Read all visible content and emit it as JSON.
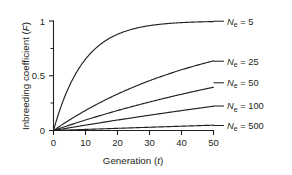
{
  "chart_data": {
    "type": "line",
    "title": "",
    "xlabel": "Generation (t)",
    "xlabel_main": "Generation (",
    "xlabel_var": "t",
    "xlabel_tail": ")",
    "ylabel": "Inbreeding coefficient (F)",
    "ylabel_main": "Inbreeding coefficient (",
    "ylabel_var": "F",
    "ylabel_tail": ")",
    "xlim": [
      0,
      50
    ],
    "ylim": [
      0,
      1
    ],
    "xticks": [
      0,
      10,
      20,
      30,
      40,
      50
    ],
    "xtick_labels": [
      "0",
      "10",
      "20",
      "30",
      "40",
      "50"
    ],
    "yticks": [
      0,
      0.5,
      1
    ],
    "ytick_labels": [
      "0",
      "0.5",
      "1"
    ],
    "yticks_minor": [
      0.25,
      0.75
    ],
    "grid": false,
    "legend_position": "right-inline-labels",
    "formula": "F = 1 - (1 - 1/(2Ne))^t",
    "series": [
      {
        "name": "Ne = 5",
        "label_prefix": "N",
        "label_sub": "e",
        "label_suffix": " = 5",
        "Ne": 5,
        "x": [
          0,
          2,
          4,
          6,
          8,
          10,
          12,
          14,
          16,
          18,
          20,
          22,
          24,
          26,
          28,
          30,
          32,
          34,
          36,
          38,
          40,
          42,
          44,
          46,
          48,
          50
        ],
        "values": [
          0,
          0.19,
          0.344,
          0.469,
          0.57,
          0.651,
          0.718,
          0.771,
          0.815,
          0.85,
          0.878,
          0.901,
          0.92,
          0.935,
          0.947,
          0.958,
          0.966,
          0.972,
          0.978,
          0.982,
          0.985,
          0.988,
          0.99,
          0.992,
          0.994,
          0.995
        ]
      },
      {
        "name": "Ne = 25",
        "label_prefix": "N",
        "label_sub": "e",
        "label_suffix": " = 25",
        "Ne": 25,
        "x": [
          0,
          5,
          10,
          15,
          20,
          25,
          30,
          35,
          40,
          45,
          50
        ],
        "values": [
          0,
          0.096,
          0.183,
          0.261,
          0.332,
          0.396,
          0.454,
          0.506,
          0.553,
          0.596,
          0.634
        ]
      },
      {
        "name": "Ne = 50",
        "label_prefix": "N",
        "label_sub": "e",
        "label_suffix": " = 50",
        "Ne": 50,
        "x": [
          0,
          5,
          10,
          15,
          20,
          25,
          30,
          35,
          40,
          45,
          50
        ],
        "values": [
          0,
          0.0494,
          0.0956,
          0.1395,
          0.1813,
          0.2209,
          0.2585,
          0.2942,
          0.3281,
          0.3603,
          0.3909
        ]
      },
      {
        "name": "Ne = 100",
        "label_prefix": "N",
        "label_sub": "e",
        "label_suffix": " = 100",
        "Ne": 100,
        "x": [
          0,
          5,
          10,
          15,
          20,
          25,
          30,
          35,
          40,
          45,
          50
        ],
        "values": [
          0,
          0.0249,
          0.0489,
          0.0724,
          0.0954,
          0.1178,
          0.1397,
          0.1611,
          0.1821,
          0.2025,
          0.2225
        ]
      },
      {
        "name": "Ne = 500",
        "label_prefix": "N",
        "label_sub": "e",
        "label_suffix": " = 500",
        "Ne": 500,
        "x": [
          0,
          10,
          20,
          30,
          40,
          50
        ],
        "values": [
          0,
          0.00999,
          0.01988,
          0.02968,
          0.03938,
          0.04898
        ]
      }
    ]
  },
  "colors": {
    "ink": "#231f20",
    "background": "#ffffff"
  }
}
